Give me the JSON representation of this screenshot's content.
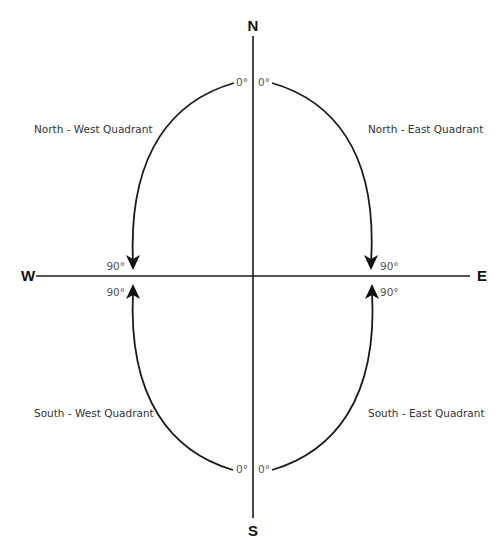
{
  "diagram": {
    "colors": {
      "line": "#1a1a1a",
      "text": "#333333",
      "degree_text": "#555555",
      "background": "#ffffff"
    },
    "cardinals": {
      "north": "N",
      "south": "S",
      "east": "E",
      "west": "W"
    },
    "quadrants": {
      "north_west": "North - West Quadrant",
      "north_east": "North - East Quadrant",
      "south_west": "South - West Quadrant",
      "south_east": "South - East Quadrant"
    },
    "angles": {
      "nw_start": "0°",
      "ne_start": "0°",
      "sw_start": "0°",
      "se_start": "0°",
      "nw_end": "90°",
      "ne_end": "90°",
      "sw_end": "90°",
      "se_end": "90°"
    }
  }
}
